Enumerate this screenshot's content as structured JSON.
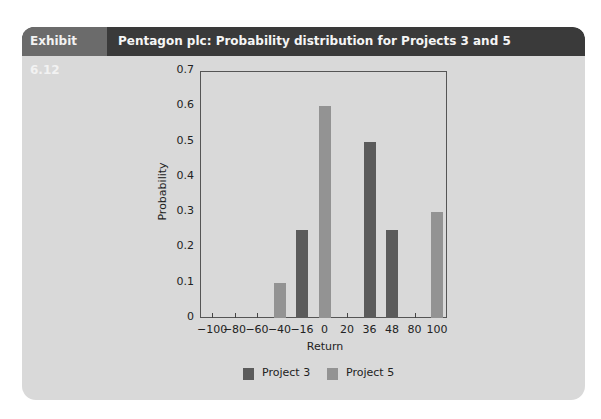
{
  "header": {
    "label": "Exhibit 6.12",
    "title": "Pentagon plc: Probability distribution for Projects 3 and 5"
  },
  "colors": {
    "project3": "#5b5b5b",
    "project5": "#939393",
    "header_dark": "#3a3a3a",
    "header_label": "#6b6b6b",
    "panel": "#d9d9d9"
  },
  "chart_data": {
    "type": "bar",
    "title": "Pentagon plc: Probability distribution for Projects 3 and 5",
    "xlabel": "Return",
    "ylabel": "Probability",
    "categories": [
      "-100",
      "-80",
      "-60",
      "-40",
      "-16",
      "0",
      "20",
      "36",
      "48",
      "80",
      "100"
    ],
    "series": [
      {
        "name": "Project 3",
        "values": [
          0,
          0,
          0,
          0,
          0.25,
          0,
          0,
          0.5,
          0.25,
          0,
          0
        ]
      },
      {
        "name": "Project 5",
        "values": [
          0,
          0,
          0,
          0.1,
          0,
          0.6,
          0,
          0,
          0,
          0,
          0.3
        ]
      }
    ],
    "ylim": [
      0,
      0.7
    ],
    "yticks": [
      "0",
      "0.1",
      "0.2",
      "0.3",
      "0.4",
      "0.5",
      "0.6",
      "0.7"
    ],
    "legend": [
      "Project 3",
      "Project 5"
    ],
    "legend_position": "bottom",
    "grid": false
  }
}
